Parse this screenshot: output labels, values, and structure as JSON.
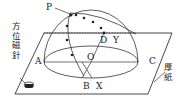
{
  "figure": {
    "type": "transparent hemisphere sun-path model on thick paper",
    "labels": {
      "P": "P",
      "D": "D",
      "Y": "Y",
      "O": "O",
      "A": "A",
      "B": "B",
      "C": "C",
      "X": "X"
    },
    "callouts": {
      "compass": "方位磁針",
      "paper": "厚紙"
    },
    "colors": {
      "line": "#333333",
      "background": "#ffffff"
    }
  }
}
